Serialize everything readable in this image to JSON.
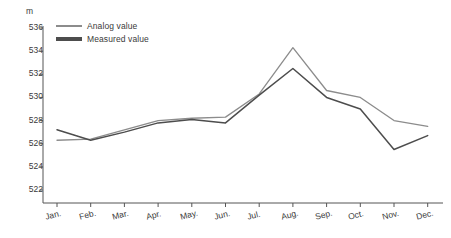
{
  "chart_data": {
    "type": "line",
    "title": "",
    "xlabel": "",
    "ylabel": "m",
    "unit": "m",
    "ylim": [
      522,
      536
    ],
    "ytick_step": 2,
    "yticks": [
      536,
      534,
      532,
      530,
      528,
      526,
      524,
      522
    ],
    "grid": false,
    "legend_position": "top-left",
    "categories": [
      "Jan.",
      "Feb.",
      "Mar.",
      "Apr.",
      "May.",
      "Jun.",
      "Jul.",
      "Aug.",
      "Sep.",
      "Oct.",
      "Nov.",
      "Dec."
    ],
    "series": [
      {
        "name": "Analog value",
        "color": "#8c8c8c",
        "values": [
          526.3,
          526.4,
          527.2,
          528.0,
          528.2,
          528.3,
          530.3,
          534.3,
          530.6,
          530.0,
          528.0,
          527.5
        ]
      },
      {
        "name": "Measured value",
        "color": "#4d4d4d",
        "values": [
          527.2,
          526.3,
          527.0,
          527.8,
          528.1,
          527.8,
          530.2,
          532.5,
          530.0,
          529.0,
          525.5,
          526.7
        ]
      }
    ]
  },
  "axis": {
    "unit_label": "m",
    "axis_color": "#555555"
  },
  "legend": {
    "items": [
      {
        "label": "Analog value",
        "color": "#8c8c8c"
      },
      {
        "label": "Measured value",
        "color": "#4d4d4d"
      }
    ]
  }
}
